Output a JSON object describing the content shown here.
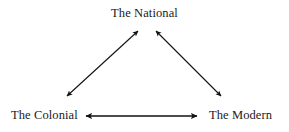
{
  "diagram": {
    "title_text": "The National",
    "type": "triangle-relationship-diagram",
    "background_color": "#ffffff",
    "line_color": "#111111",
    "text_color": "#1a1a1a",
    "nodes": [
      {
        "id": "national",
        "label": "The National",
        "position": "top-center"
      },
      {
        "id": "colonial",
        "label": "The Colonial",
        "position": "bottom-left"
      },
      {
        "id": "modern",
        "label": "The Modern",
        "position": "bottom-right"
      }
    ],
    "edges": [
      {
        "id": "colonial-national",
        "from": "The Colonial",
        "to": "The National",
        "style": "double-headed-arrow"
      },
      {
        "id": "national-modern",
        "from": "The National",
        "to": "The Modern",
        "style": "double-headed-arrow"
      },
      {
        "id": "colonial-modern",
        "from": "The Colonial",
        "to": "The Modern",
        "style": "double-headed-arrow"
      }
    ]
  }
}
